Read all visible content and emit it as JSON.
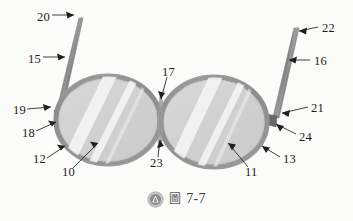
{
  "figure": {
    "caption": {
      "logo_icon": "circle-triangle-logo-icon",
      "cjk_label": "圖",
      "number": "7-7"
    },
    "colors": {
      "background": "#fbfbfa",
      "lens_fill": "#d2d2d2",
      "lens_fill_light": "#dcdcdc",
      "lens_highlight": "#f4f4f4",
      "rim_outer": "#8f8f8f",
      "rim_inner": "#b4b4b4",
      "temple_arm": "#8d8d8d",
      "temple_arm_dark": "#6f6f6f",
      "hinge_block": "#6a6a6a",
      "leader_line": "#2b2b2b",
      "label_text": "#1c1c1c"
    },
    "parts": [
      {
        "id": "10",
        "name": "left-lens-body",
        "label": "10",
        "x": 62,
        "y": 172
      },
      {
        "id": "11",
        "name": "right-lens-body",
        "label": "11",
        "x": 243,
        "y": 172
      },
      {
        "id": "12",
        "name": "left-rim",
        "label": "12",
        "x": 34,
        "y": 157
      },
      {
        "id": "13",
        "name": "right-rim",
        "label": "13",
        "x": 281,
        "y": 157
      },
      {
        "id": "15",
        "name": "left-temple-arm",
        "label": "15",
        "x": 28,
        "y": 53
      },
      {
        "id": "16",
        "name": "right-temple-arm",
        "label": "16",
        "x": 313,
        "y": 56
      },
      {
        "id": "17",
        "name": "upper-bridge-joint",
        "label": "17",
        "x": 163,
        "y": 69
      },
      {
        "id": "18",
        "name": "left-hinge-lower",
        "label": "18",
        "x": 22,
        "y": 131
      },
      {
        "id": "19",
        "name": "left-hinge",
        "label": "19",
        "x": 13,
        "y": 106
      },
      {
        "id": "20",
        "name": "left-temple-tip",
        "label": "20",
        "x": 37,
        "y": 11
      },
      {
        "id": "21",
        "name": "right-hinge",
        "label": "21",
        "x": 310,
        "y": 105
      },
      {
        "id": "22",
        "name": "right-temple-tip",
        "label": "22",
        "x": 322,
        "y": 22
      },
      {
        "id": "23",
        "name": "lower-bridge-joint",
        "label": "23",
        "x": 152,
        "y": 161
      },
      {
        "id": "24",
        "name": "right-hinge-lower",
        "label": "24",
        "x": 297,
        "y": 136
      }
    ]
  }
}
